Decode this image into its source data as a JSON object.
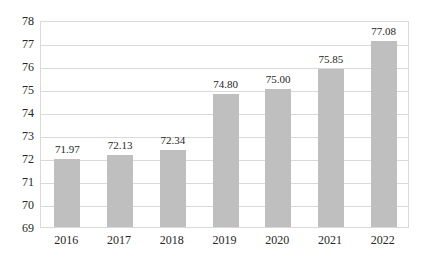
{
  "chart": {
    "background": "#ffffff",
    "bar_color": "#bfbfbf",
    "grid_color": "#d9d9d9",
    "border_color": "#d9d9d9",
    "text_color": "#262626"
  },
  "chart_data": {
    "type": "bar",
    "categories": [
      "2016",
      "2017",
      "2018",
      "2019",
      "2020",
      "2021",
      "2022"
    ],
    "values": [
      71.97,
      72.13,
      72.34,
      74.8,
      75.0,
      75.85,
      77.08
    ],
    "data_labels": [
      "71.97",
      "72.13",
      "72.34",
      "74.80",
      "75.00",
      "75.85",
      "77.08"
    ],
    "title": "",
    "xlabel": "",
    "ylabel": "",
    "ylim": [
      69,
      78
    ],
    "ytick_interval": 1,
    "ytick_labels": [
      "69",
      "70",
      "71",
      "72",
      "73",
      "74",
      "75",
      "76",
      "77",
      "78"
    ],
    "grid": "horizontal",
    "legend": "none",
    "gridlines_at": [
      70,
      71,
      72,
      73,
      74,
      75,
      76,
      77
    ]
  }
}
